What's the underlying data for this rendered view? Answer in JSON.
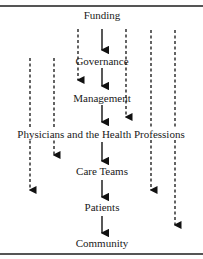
{
  "diagram": {
    "nodes": [
      {
        "id": "funding",
        "label": "Funding",
        "x": 102,
        "y": 15
      },
      {
        "id": "governance",
        "label": "Governance",
        "x": 102,
        "y": 55
      },
      {
        "id": "management",
        "label": "Management",
        "x": 102,
        "y": 92
      },
      {
        "id": "physicians",
        "label": "Physicians and the Health Professions",
        "x": 101,
        "y": 128
      },
      {
        "id": "care_teams",
        "label": "Care Teams",
        "x": 102,
        "y": 167
      },
      {
        "id": "patients",
        "label": "Patients",
        "x": 102,
        "y": 203
      },
      {
        "id": "community",
        "label": "Community",
        "x": 102,
        "y": 239
      }
    ],
    "solid_arrows": [
      {
        "from": "funding",
        "to": "governance"
      },
      {
        "from": "governance",
        "to": "management"
      },
      {
        "from": "management",
        "to": "physicians"
      },
      {
        "from": "physicians",
        "to": "care_teams"
      },
      {
        "from": "care_teams",
        "to": "patients"
      },
      {
        "from": "patients",
        "to": "community"
      }
    ],
    "dashed_arrows": [
      {
        "from": "funding",
        "to": "management"
      },
      {
        "from": "funding",
        "to": "physicians"
      },
      {
        "from": "governance",
        "to": "care_teams"
      },
      {
        "from": "governance",
        "to": "physicians"
      },
      {
        "from": "funding",
        "to": "care_teams"
      },
      {
        "from": "funding",
        "to": "patients"
      }
    ]
  }
}
